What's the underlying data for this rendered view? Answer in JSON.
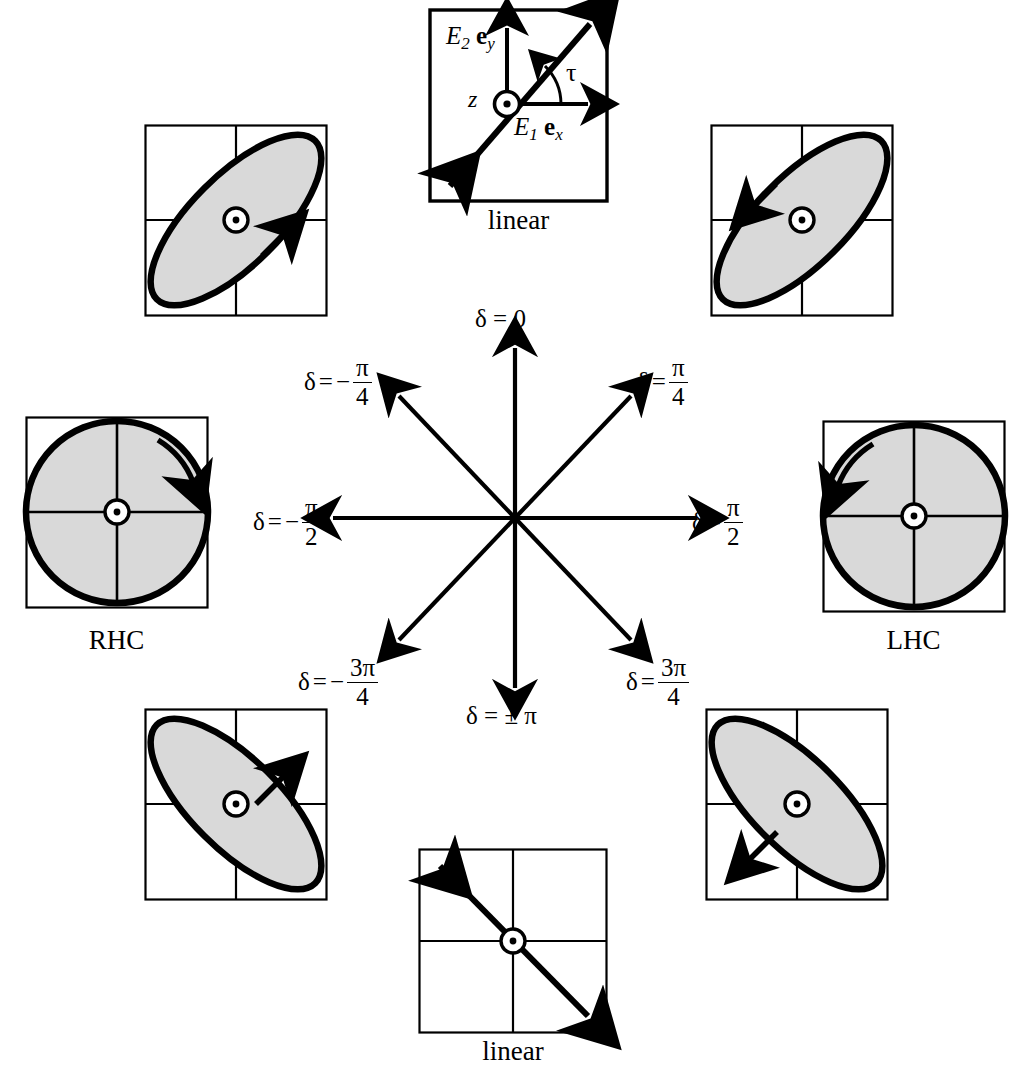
{
  "figure": {
    "background_color": "#ffffff",
    "stroke_color": "#000000",
    "fill_color": "#d9d9d9"
  },
  "top_panel": {
    "caption": "linear",
    "axis_y_label_E": "E",
    "axis_y_label_sub": "2",
    "axis_y_label_unit": "e",
    "axis_y_label_unit_sub": "y",
    "axis_x_label_E": "E",
    "axis_x_label_sub": "1",
    "axis_x_label_unit": "e",
    "axis_x_label_unit_sub": "x",
    "angle_label": "τ",
    "propagation_label": "z"
  },
  "bottom_panel": {
    "caption": "linear"
  },
  "left_circle_panel": {
    "caption": "RHC"
  },
  "right_circle_panel": {
    "caption": "LHC"
  },
  "star": {
    "center": {
      "x": 515,
      "y": 518
    },
    "arms": [
      {
        "name": "delta-0",
        "angle_deg": 90,
        "label": "δ = 0"
      },
      {
        "name": "delta-pi-over-4",
        "angle_deg": 45,
        "label": "δ = π/4"
      },
      {
        "name": "delta-pi-over-2",
        "angle_deg": 0,
        "label": "δ = π/2"
      },
      {
        "name": "delta-3pi-over-4",
        "angle_deg": -45,
        "label": "δ = 3π/4"
      },
      {
        "name": "delta-plus-minus-pi",
        "angle_deg": -90,
        "label": "δ = ±π"
      },
      {
        "name": "delta-neg-3pi-over-4",
        "angle_deg": -135,
        "label": "δ = -3π/4"
      },
      {
        "name": "delta-neg-pi-over-2",
        "angle_deg": 180,
        "label": "δ = -π/2"
      },
      {
        "name": "delta-neg-pi-over-4",
        "angle_deg": 135,
        "label": "δ = -π/4"
      }
    ]
  },
  "labels": {
    "delta": "δ",
    "equals": "=",
    "minus": "−",
    "plusminus": "±",
    "pi": "π",
    "zero": "0",
    "four": "4",
    "two": "2",
    "three_pi": "3π",
    "delta_0_text": "δ = 0",
    "delta_pm_pi_text": "δ = ± π"
  },
  "ellipse_panels": [
    {
      "name": "top-left-ellipse",
      "delta": "-π/4",
      "tilt_deg": -45,
      "handedness": "right",
      "arrow_direction": "up-right",
      "shape": "ellipse"
    },
    {
      "name": "top-right-ellipse",
      "delta": "π/4",
      "tilt_deg": -45,
      "handedness": "left",
      "arrow_direction": "up-left",
      "shape": "ellipse"
    },
    {
      "name": "left-circle",
      "delta": "-π/2",
      "tilt_deg": 0,
      "handedness": "right",
      "arrow_direction": "clockwise",
      "shape": "circle"
    },
    {
      "name": "right-circle",
      "delta": "π/2",
      "tilt_deg": 0,
      "handedness": "left",
      "arrow_direction": "counter-clockwise",
      "shape": "circle"
    },
    {
      "name": "bottom-left-ellipse",
      "delta": "-3π/4",
      "tilt_deg": 45,
      "handedness": "right",
      "arrow_direction": "up-right",
      "shape": "ellipse"
    },
    {
      "name": "bottom-right-ellipse",
      "delta": "3π/4",
      "tilt_deg": 45,
      "handedness": "left",
      "arrow_direction": "down-left",
      "shape": "ellipse"
    }
  ]
}
